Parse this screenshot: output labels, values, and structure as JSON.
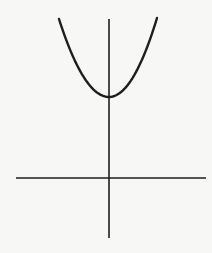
{
  "chart_data": {
    "type": "line",
    "title": "",
    "xlabel": "",
    "ylabel": "",
    "series": [
      {
        "name": "parabola",
        "equation": "y = x^2 + c",
        "vertex": [
          0,
          "c"
        ],
        "opens": "up"
      }
    ],
    "axes": {
      "x_axis": true,
      "y_axis": true,
      "ticks": false,
      "grid": false
    },
    "legend": null
  },
  "colors": {
    "background": "#f7f7f5",
    "stroke": "#1e1e1e"
  },
  "geometry": {
    "x_axis": {
      "x1": 16,
      "x2": 206,
      "y": 178
    },
    "y_axis": {
      "x": 109,
      "y1": 19,
      "y2": 238
    },
    "curve": {
      "left": [
        59,
        19
      ],
      "vertex": [
        109,
        97
      ],
      "right": [
        157,
        18
      ]
    }
  }
}
